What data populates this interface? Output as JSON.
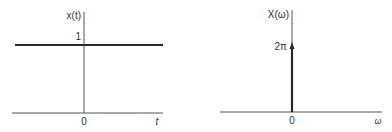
{
  "left_plot": {
    "y_label": "x(t)",
    "x_label": "t",
    "origin_label": "0",
    "level_label": "1",
    "description": "constant signal x(t) = 1"
  },
  "right_plot": {
    "y_label": "X(ω)",
    "x_label": "ω",
    "origin_label": "0",
    "impulse_label": "2π",
    "description": "impulse of area 2π at ω = 0"
  },
  "colors": {
    "line": "#2a2a2a",
    "axis": "#555555",
    "background": "#ffffff"
  }
}
